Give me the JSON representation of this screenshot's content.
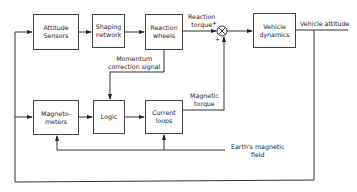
{
  "blocks": {
    "attitude_sensors": {
      "line1": "Attitude",
      "line2": "Sensors"
    },
    "shaping_network": {
      "line1": "Shaping",
      "line2": "network"
    },
    "reaction_wheels": {
      "line1": "Reaction",
      "line2": "wheels"
    },
    "vehicle_dynamics": {
      "line1": "Vehicle",
      "line2": "dynamics"
    },
    "magnetometers": {
      "line1": "Magneto-",
      "line2": "meters"
    },
    "logic": {
      "line1": "Logic"
    },
    "current_loops": {
      "line1": "Current",
      "line2": "loops"
    }
  },
  "summing_junction": {
    "plus_top": "+",
    "plus_bottom": "+"
  },
  "signals": {
    "reaction_torque": {
      "line1": "Reaction",
      "line2": "torque"
    },
    "vehicle_attitude": "Vehicle attitude",
    "momentum_correction": {
      "line1": "Momentum",
      "line2": "correction  signal"
    },
    "magnetic_torque": {
      "line1": "Magnetic",
      "line2": "torque"
    },
    "earth_field": {
      "line1": "Earth's magnetic",
      "line2": "field"
    }
  }
}
